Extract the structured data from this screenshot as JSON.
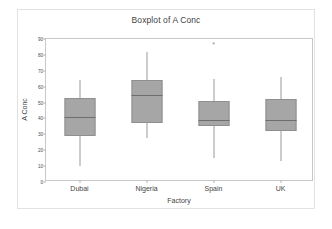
{
  "chart_data": {
    "type": "box",
    "title": "Boxplot of A Conc",
    "xlabel": "Factory",
    "ylabel": "A Conc",
    "categories": [
      "Dubai",
      "Nigeria",
      "Spain",
      "UK"
    ],
    "ylim": [
      0,
      90
    ],
    "yticks": [
      0,
      10,
      20,
      30,
      40,
      50,
      60,
      70,
      80,
      90
    ],
    "grid": false,
    "legend": null,
    "boxes": [
      {
        "category": "Dubai",
        "whisker_low": 10,
        "q1": 29,
        "median": 41,
        "q3": 53,
        "whisker_high": 64,
        "outliers": []
      },
      {
        "category": "Nigeria",
        "whisker_low": 28,
        "q1": 37,
        "median": 55,
        "q3": 64,
        "whisker_high": 82,
        "outliers": []
      },
      {
        "category": "Spain",
        "whisker_low": 15,
        "q1": 35,
        "median": 39,
        "q3": 51,
        "whisker_high": 65,
        "outliers": [
          87
        ]
      },
      {
        "category": "UK",
        "whisker_low": 13,
        "q1": 32,
        "median": 39,
        "q3": 52,
        "whisker_high": 66,
        "outliers": []
      }
    ],
    "box_fill": "#a6a6a6",
    "box_edge": "#8f8f8f",
    "median_color": "#6e6e6e",
    "whisker_color": "#9a9a9a",
    "outlier_marker": "*"
  }
}
